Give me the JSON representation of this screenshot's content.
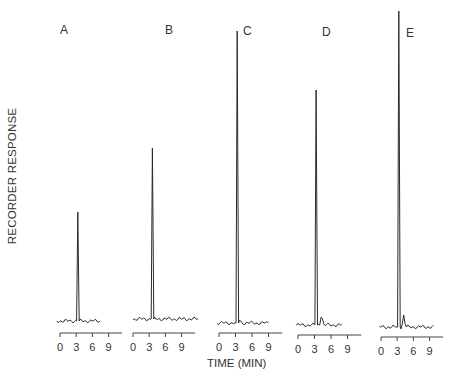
{
  "chart_data": {
    "type": "line",
    "title": "",
    "xlabel": "TIME (MIN)",
    "ylabel": "RECORDER RESPONSE",
    "grid": false,
    "legend": null,
    "x_ticks": [
      "0",
      "3",
      "6",
      "9"
    ],
    "xlim": [
      0,
      10
    ],
    "panels": [
      {
        "label": "A",
        "peak_time_min": 3.3,
        "peak_height": 109,
        "secondary_peak": null
      },
      {
        "label": "B",
        "peak_time_min": 3.6,
        "peak_height": 171,
        "secondary_peak": null
      },
      {
        "label": "C",
        "peak_time_min": 3.3,
        "peak_height": 292,
        "secondary_peak": null
      },
      {
        "label": "D",
        "peak_time_min": 3.3,
        "peak_height": 235,
        "secondary_peak": {
          "time_min": 4.3,
          "height": 11
        }
      },
      {
        "label": "E",
        "peak_time_min": 3.3,
        "peak_height": 316,
        "secondary_peak": {
          "time_min": 4.2,
          "height": 12
        }
      }
    ],
    "units_note": "peak heights in arbitrary recorder units (relative)"
  },
  "labels": {
    "y_axis": "RECORDER RESPONSE",
    "x_axis": "TIME (MIN)",
    "panels": [
      "A",
      "B",
      "C",
      "D",
      "E"
    ],
    "ticks": [
      "0",
      "3",
      "6",
      "9"
    ]
  }
}
